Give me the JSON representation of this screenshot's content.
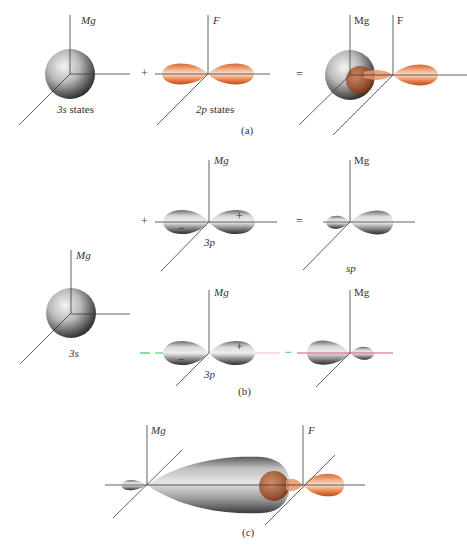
{
  "figure": {
    "colors": {
      "axis": "#3a3a3a",
      "mg_orbital_light": "#f2f2f2",
      "mg_orbital_dark": "#2b2b2b",
      "f_orbital_light": "#fbe3d2",
      "f_orbital_dark": "#c4521c",
      "green_dashed_line": "#3cc35a",
      "pink_line": "#e0507a"
    },
    "panel_a": {
      "caption": "(a)",
      "operator_plus": "+",
      "operator_equals": "=",
      "mg_s": {
        "axis_label": "Mg",
        "state_label": "3s states"
      },
      "f_p": {
        "axis_label": "F",
        "state_label": "2p states"
      },
      "combined": {
        "mg_label": "Mg",
        "f_label": "F"
      }
    },
    "panel_b": {
      "caption": "(b)",
      "s_orbital": {
        "axis_label": "Mg",
        "state_label": "3s"
      },
      "top_row": {
        "operator_plus": "+",
        "p_orbital": {
          "axis_label": "Mg",
          "state_label": "3p",
          "plus_sign": "+",
          "minus_sign": "−"
        },
        "operator_equals": "=",
        "result": {
          "axis_label": "Mg",
          "state_label": "sp"
        }
      },
      "bottom_row": {
        "p_orbital": {
          "axis_label": "Mg",
          "state_label": "3p",
          "plus_sign": "+",
          "minus_sign": "−"
        },
        "operator_minus": "−",
        "result": {
          "axis_label": "Mg"
        }
      }
    },
    "panel_c": {
      "caption": "(c)",
      "mg_label": "Mg",
      "f_label": "F"
    }
  }
}
